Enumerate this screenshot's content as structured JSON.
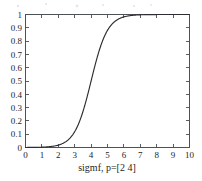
{
  "chart_data": {
    "type": "line",
    "title": "",
    "subtitle": "",
    "xlabel": "sigmf, p=[2 4]",
    "ylabel": "",
    "xlim": [
      0,
      10
    ],
    "ylim": [
      0,
      1
    ],
    "grid": false,
    "legend": false,
    "legend_position": "none",
    "box": true,
    "tick_direction": "in",
    "xticks": [
      0,
      1,
      2,
      3,
      4,
      5,
      6,
      7,
      8,
      9,
      10
    ],
    "xtick_labels": [
      "0",
      "1",
      "2",
      "3",
      "4",
      "5",
      "6",
      "7",
      "8",
      "9",
      "10"
    ],
    "yticks": [
      0,
      0.1,
      0.2,
      0.3,
      0.4,
      0.5,
      0.6,
      0.7,
      0.8,
      0.9,
      1
    ],
    "ytick_labels": [
      "0",
      "0.1",
      "0.2",
      "0.3",
      "0.4",
      "0.5",
      "0.6",
      "0.7",
      "0.8",
      "0.9",
      "1"
    ],
    "series": [
      {
        "name": "sigmf, p=[2 4]",
        "color": "#2b2d31",
        "formula": "1/(1+exp(-2*(x-4)))",
        "params": {
          "a": 2,
          "c": 4
        },
        "x": [
          0,
          0.25,
          0.5,
          0.75,
          1,
          1.25,
          1.5,
          1.75,
          2,
          2.25,
          2.5,
          2.75,
          3,
          3.25,
          3.5,
          3.75,
          4,
          4.25,
          4.5,
          4.75,
          5,
          5.25,
          5.5,
          5.75,
          6,
          6.25,
          6.5,
          6.75,
          7,
          7.5,
          8,
          8.5,
          9,
          9.5,
          10
        ],
        "values": [
          0.0003,
          0.0006,
          0.0009,
          0.0015,
          0.0025,
          0.0041,
          0.0067,
          0.011,
          0.018,
          0.0293,
          0.0474,
          0.0759,
          0.1192,
          0.1824,
          0.2689,
          0.3775,
          0.5,
          0.6225,
          0.7311,
          0.8176,
          0.8808,
          0.9241,
          0.9526,
          0.9707,
          0.982,
          0.989,
          0.9933,
          0.9959,
          0.9975,
          0.9991,
          0.9997,
          0.9999,
          1.0,
          1.0,
          1.0
        ]
      }
    ]
  },
  "colors": {
    "curve": "#2b2d31",
    "axis": "#4e5156",
    "text": "#222428",
    "background": "#ffffff"
  }
}
